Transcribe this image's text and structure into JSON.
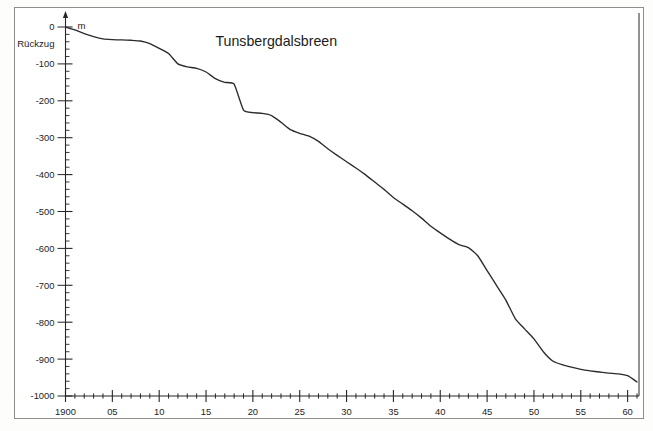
{
  "figure": {
    "title": "Tunsbergdalsbreen",
    "unit_label": "m",
    "side_label": "Rückzug"
  },
  "chart_data": {
    "type": "line",
    "title": "Tunsbergdalsbreen",
    "subtitle": "",
    "xlabel": "",
    "ylabel": "m",
    "annotations": [
      "Rückzug",
      "m"
    ],
    "grid": false,
    "legend_position": "none",
    "xlim": [
      1900,
      1961
    ],
    "ylim": [
      -1000,
      0
    ],
    "y_tick_labels": [
      "0",
      "-100",
      "-200",
      "-300",
      "-400",
      "-500",
      "-600",
      "-700",
      "-800",
      "-900",
      "-1000"
    ],
    "y_ticks": [
      0,
      -100,
      -200,
      -300,
      -400,
      -500,
      -600,
      -700,
      -800,
      -900,
      -1000
    ],
    "y_minor_tick_interval": 20,
    "x_tick_labels": [
      "1900",
      "05",
      "10",
      "15",
      "20",
      "25",
      "30",
      "35",
      "40",
      "45",
      "50",
      "55",
      "60"
    ],
    "x_ticks": [
      1900,
      1905,
      1910,
      1915,
      1920,
      1925,
      1930,
      1935,
      1940,
      1945,
      1950,
      1955,
      1960
    ],
    "x_minor_tick_interval": 1,
    "series": [
      {
        "name": "Cumulative glacier retreat",
        "x": [
          1900,
          1901,
          1902,
          1903,
          1904,
          1905,
          1906,
          1907,
          1908,
          1909,
          1910,
          1911,
          1912,
          1913,
          1914,
          1915,
          1916,
          1917,
          1918,
          1919,
          1920,
          1921,
          1922,
          1923,
          1924,
          1925,
          1926,
          1927,
          1928,
          1929,
          1930,
          1931,
          1932,
          1933,
          1934,
          1935,
          1936,
          1937,
          1938,
          1939,
          1940,
          1941,
          1942,
          1943,
          1944,
          1945,
          1946,
          1947,
          1948,
          1949,
          1950,
          1951,
          1952,
          1953,
          1954,
          1955,
          1956,
          1957,
          1958,
          1959,
          1960,
          1961
        ],
        "y": [
          0,
          -8,
          -18,
          -26,
          -32,
          -34,
          -35,
          -36,
          -38,
          -45,
          -58,
          -72,
          -100,
          -108,
          -112,
          -122,
          -140,
          -150,
          -155,
          -225,
          -232,
          -234,
          -240,
          -258,
          -278,
          -288,
          -296,
          -310,
          -330,
          -348,
          -365,
          -382,
          -400,
          -420,
          -440,
          -462,
          -480,
          -498,
          -518,
          -540,
          -558,
          -575,
          -590,
          -598,
          -620,
          -660,
          -700,
          -740,
          -790,
          -818,
          -845,
          -880,
          -905,
          -915,
          -922,
          -928,
          -932,
          -935,
          -938,
          -940,
          -945,
          -962
        ]
      }
    ]
  }
}
